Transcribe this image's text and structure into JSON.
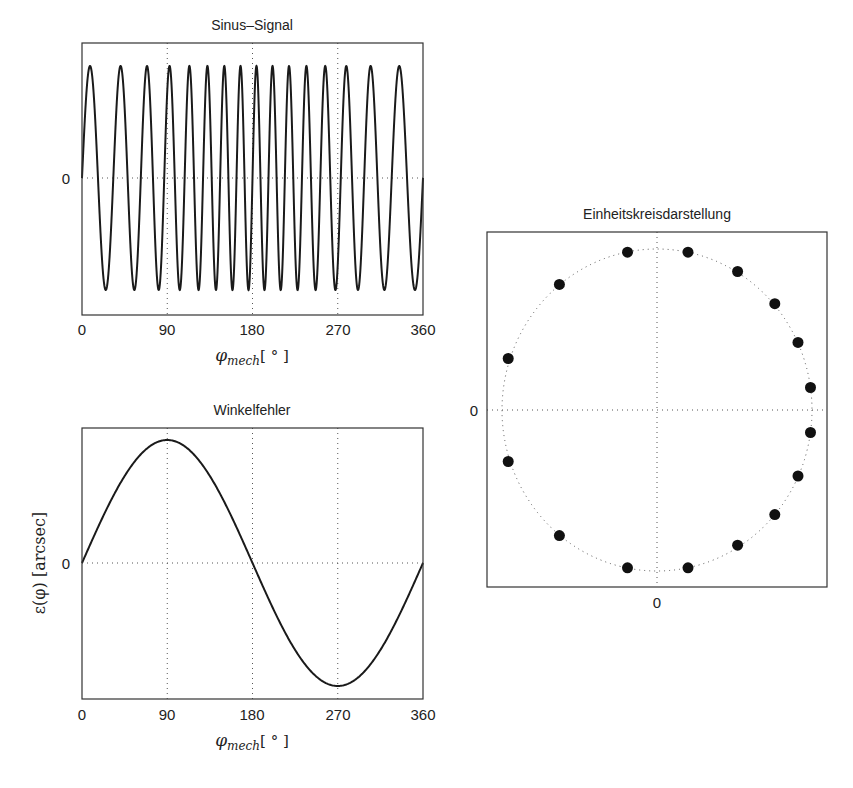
{
  "chart_data": [
    {
      "id": "sinus",
      "type": "line",
      "title": "Sinus–Signal",
      "xlabel": "φmech [°]",
      "ylabel": "",
      "x_ticks": [
        "0",
        "90",
        "180",
        "270",
        "360"
      ],
      "y_ticks": [
        "0"
      ],
      "xlim": [
        0,
        360
      ],
      "ylim": [
        -1.2,
        1.2
      ],
      "grid": true,
      "series": [
        {
          "name": "signal",
          "description": "sinusoid with 16 periods over 360°, phase-modulated (wider periods around 90–200°)",
          "periods": 16,
          "amplitude": 1,
          "phase_modulation": 0.9
        }
      ]
    },
    {
      "id": "winkelfehler",
      "type": "line",
      "title": "Winkelfehler",
      "xlabel": "φmech [°]",
      "ylabel": "ε(φ) [arcsec]",
      "x_ticks": [
        "0",
        "90",
        "180",
        "270",
        "360"
      ],
      "y_ticks": [
        "0"
      ],
      "xlim": [
        0,
        360
      ],
      "ylim": [
        -1.1,
        1.1
      ],
      "grid": true,
      "series": [
        {
          "name": "error",
          "x": [
            0,
            45,
            90,
            135,
            180,
            225,
            270,
            315,
            360
          ],
          "values": [
            0,
            0.707,
            1,
            0.707,
            0,
            -0.707,
            -1,
            -0.707,
            0
          ]
        }
      ]
    },
    {
      "id": "einheitskreis",
      "type": "scatter",
      "title": "Einheitskreisdarstellung",
      "xlabel": "",
      "ylabel": "",
      "x_ticks": [
        "0"
      ],
      "y_ticks": [
        "0"
      ],
      "xlim": [
        -1.1,
        1.1
      ],
      "ylim": [
        -1.1,
        1.1
      ],
      "grid": true,
      "reference_circle": {
        "radius": 1,
        "style": "dotted"
      },
      "points": [
        {
          "x": -0.19,
          "y": 0.98
        },
        {
          "x": 0.2,
          "y": 0.98
        },
        {
          "x": 0.52,
          "y": 0.86
        },
        {
          "x": 0.76,
          "y": 0.66
        },
        {
          "x": 0.91,
          "y": 0.42
        },
        {
          "x": 0.99,
          "y": 0.14
        },
        {
          "x": 0.99,
          "y": -0.14
        },
        {
          "x": 0.91,
          "y": -0.41
        },
        {
          "x": 0.76,
          "y": -0.65
        },
        {
          "x": 0.52,
          "y": -0.84
        },
        {
          "x": 0.2,
          "y": -0.98
        },
        {
          "x": -0.19,
          "y": -0.98
        },
        {
          "x": -0.63,
          "y": -0.78
        },
        {
          "x": -0.96,
          "y": -0.32
        },
        {
          "x": -0.96,
          "y": 0.32
        },
        {
          "x": -0.63,
          "y": 0.78
        }
      ]
    }
  ],
  "labels": {
    "sinus_title": "Sinus–Signal",
    "error_title": "Winkelfehler",
    "circle_title": "Einheitskreisdarstellung",
    "phi": "φ",
    "mech": "mech",
    "deg_unit": "[ ° ]",
    "error_ylabel": "ε(φ) [arcsec]",
    "zero": "0",
    "xt0": "0",
    "xt90": "90",
    "xt180": "180",
    "xt270": "270",
    "xt360": "360"
  }
}
